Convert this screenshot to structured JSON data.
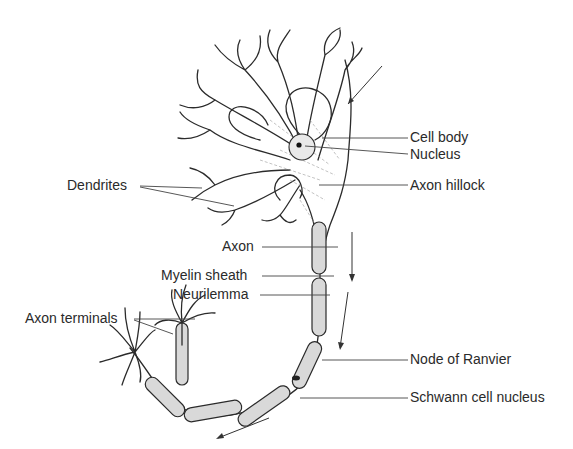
{
  "diagram": {
    "colors": {
      "background": "#ffffff",
      "line": "#2b2b2b",
      "myelin_fill": "#d9d9d9",
      "label_text": "#2a2a2a"
    },
    "labels": {
      "cell_body": "Cell body",
      "nucleus": "Nucleus",
      "dendrites": "Dendrites",
      "axon_hillock": "Axon hillock",
      "axon": "Axon",
      "myelin_sheath": "Myelin sheath",
      "neurilemma": "Neurilemma",
      "axon_terminals": "Axon terminals",
      "node_of_ranvier": "Node of Ranvier",
      "schwann_cell_nucleus": "Schwann cell nucleus"
    },
    "arrows": [
      "signal-input-arrow",
      "axon-conduction-arrow-upper",
      "axon-conduction-arrow-middle",
      "axon-conduction-arrow-lower"
    ]
  }
}
